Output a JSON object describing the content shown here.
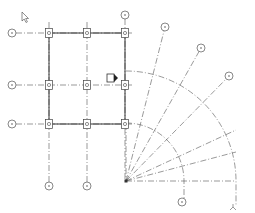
{
  "view": {
    "title": "Grid layout plan view",
    "background": "#ffffff",
    "line_color": "#555555",
    "beam_color": "#333333"
  },
  "cursor": {
    "x": 22,
    "y": 12,
    "name": "mouse-pointer"
  },
  "grids": {
    "vertical": [
      {
        "id": "1",
        "x": 49,
        "bubble": {
          "x": 49,
          "y": 186
        }
      },
      {
        "id": "2",
        "x": 87,
        "bubble": {
          "x": 87,
          "y": 186
        }
      },
      {
        "id": "3",
        "x": 125,
        "bubble": {
          "x": 125,
          "y": 15
        }
      }
    ],
    "horizontal": [
      {
        "id": "C",
        "y": 33,
        "bubble": {
          "x": 12,
          "y": 33
        }
      },
      {
        "id": "B",
        "y": 85,
        "bubble": {
          "x": 12,
          "y": 85
        }
      },
      {
        "id": "A",
        "y": 124,
        "bubble": {
          "x": 12,
          "y": 124
        }
      }
    ],
    "radial": {
      "center": {
        "x": 126,
        "y": 181
      },
      "lines": [
        {
          "id": "R1",
          "bubble": {
            "x": 165,
            "y": 27
          }
        },
        {
          "id": "R2",
          "bubble": {
            "x": 201,
            "y": 48
          }
        },
        {
          "id": "R3",
          "bubble": {
            "x": 229,
            "y": 76
          }
        },
        {
          "id": "R4",
          "end": {
            "x": 236,
            "y": 130
          }
        },
        {
          "id": "R5",
          "end": {
            "x": 236,
            "y": 152
          }
        },
        {
          "id": "R6",
          "end": {
            "x": 236,
            "y": 181
          }
        }
      ],
      "arcs": [
        {
          "id": "arc-inner",
          "radius": 58,
          "bubble": {
            "x": 182,
            "y": 202
          }
        },
        {
          "id": "arc-outer",
          "radius": 110,
          "end_marker": {
            "x": 233,
            "y": 208
          }
        }
      ]
    }
  },
  "columns": [
    {
      "x": 49,
      "y": 33
    },
    {
      "x": 87,
      "y": 33
    },
    {
      "x": 125,
      "y": 33
    },
    {
      "x": 49,
      "y": 85
    },
    {
      "x": 87,
      "y": 85
    },
    {
      "x": 125,
      "y": 85
    },
    {
      "x": 49,
      "y": 124
    },
    {
      "x": 87,
      "y": 124
    },
    {
      "x": 125,
      "y": 124
    }
  ],
  "section_marker": {
    "x": 110,
    "y": 78
  }
}
